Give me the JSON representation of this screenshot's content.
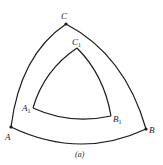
{
  "diagram": {
    "outer_triangle": {
      "vertices": {
        "A": {
          "label": "A",
          "x": 11,
          "y": 127
        },
        "B": {
          "label": "B",
          "x": 146,
          "y": 129
        },
        "C": {
          "label": "C",
          "x": 66,
          "y": 24
        }
      }
    },
    "inner_triangle": {
      "vertices": {
        "A1": {
          "label": "A",
          "subscript": "1",
          "x": 33,
          "y": 108
        },
        "B1": {
          "label": "B",
          "subscript": "1",
          "x": 111,
          "y": 116
        },
        "C1": {
          "label": "C",
          "subscript": "1",
          "x": 77,
          "y": 48
        }
      }
    },
    "caption": "(a)",
    "stroke_color": "#1a1a1a"
  }
}
